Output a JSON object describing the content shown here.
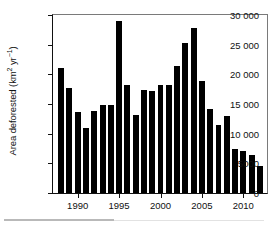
{
  "chart_data": {
    "type": "bar",
    "title": "",
    "xlabel": "",
    "ylabel": "Area deforested (km2 yr-1)",
    "ylabel_parts": {
      "prefix": "Area deforested (km",
      "sup1": "2",
      "mid": " yr",
      "sup2": "−1",
      "suffix": ")"
    },
    "categories": [
      "1988",
      "1989",
      "1990",
      "1991",
      "1992",
      "1993",
      "1994",
      "1995",
      "1996",
      "1997",
      "1998",
      "1999",
      "2000",
      "2001",
      "2002",
      "2003",
      "2004",
      "2005",
      "2006",
      "2007",
      "2008",
      "2009",
      "2010",
      "2011",
      "2012"
    ],
    "values": [
      21050,
      17770,
      13730,
      11030,
      13790,
      14900,
      14900,
      29060,
      18160,
      13230,
      17380,
      17260,
      18170,
      18170,
      21400,
      25250,
      27770,
      18850,
      14110,
      11530,
      12910,
      7460,
      7000,
      6420,
      4570
    ],
    "ylim": [
      0,
      30000
    ],
    "xlim": [
      1987.5,
      2012.5
    ],
    "ytick_values": [
      0,
      5000,
      10000,
      15000,
      20000,
      25000,
      30000
    ],
    "ytick_labels": [
      "0",
      "5000",
      "10 000",
      "15 000",
      "20 000",
      "25 000",
      "30 000"
    ],
    "xtick_values": [
      1990,
      1995,
      2000,
      2005,
      2010
    ],
    "xtick_labels": [
      "1990",
      "1995",
      "2000",
      "2005",
      "2010"
    ],
    "grid": false,
    "legend": false,
    "bar_color": "#000000",
    "axis_color": "#111111",
    "frame_color": "#7a7a7a",
    "background": "#ffffff"
  }
}
